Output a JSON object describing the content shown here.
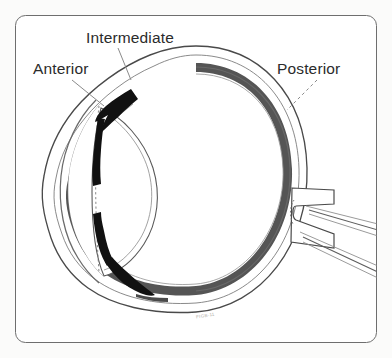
{
  "figure": {
    "name": "eye-cross-section-uveal-tract",
    "caption_credit": "FIGB-11",
    "frame": {
      "border_color": "#6e6e6e",
      "border_width_px": 1,
      "corner_radius_px": 10,
      "inset_px": 15,
      "fill_color": "#ffffff"
    },
    "background_color": "#fbfbfa"
  },
  "labels": [
    {
      "id": "anterior",
      "text": "Anterior",
      "x": 33,
      "y": 61,
      "color": "#2b2b2b"
    },
    {
      "id": "intermediate",
      "text": "Intermediate",
      "x": 86,
      "y": 30,
      "color": "#2b2b2b"
    },
    {
      "id": "posterior",
      "text": "Posterior",
      "x": 277,
      "y": 61,
      "color": "#2b2b2b"
    }
  ],
  "leader_lines": [
    {
      "id": "anterior-leader",
      "style": "solid",
      "from": [
        72,
        80
      ],
      "to": [
        101,
        103
      ],
      "color": "#8a8a8a"
    },
    {
      "id": "intermediate-leader",
      "style": "solid",
      "from": [
        118,
        48
      ],
      "to": [
        131,
        77
      ],
      "color": "#8a8a8a"
    },
    {
      "id": "posterior-leader",
      "style": "dashed",
      "from": [
        316,
        80
      ],
      "to": [
        288,
        108
      ],
      "color": "#8a8a8a"
    }
  ],
  "anatomy": {
    "structures": [
      {
        "name": "sclera-outer-wall",
        "color": "#ffffff",
        "stroke": "#4a4a4a"
      },
      {
        "name": "choroid-band",
        "color": "#555555"
      },
      {
        "name": "retina-inner-line",
        "color": "#8f8f8f"
      },
      {
        "name": "cornea",
        "color": "#ffffff",
        "stroke": "#6a6a6a"
      },
      {
        "name": "lens",
        "color": "#ffffff",
        "stroke": "#5a5a5a"
      },
      {
        "name": "iris-upper",
        "color": "#111111"
      },
      {
        "name": "iris-lower",
        "color": "#111111"
      },
      {
        "name": "ciliary-body-upper",
        "color": "#111111"
      },
      {
        "name": "ciliary-body-lower",
        "color": "#111111"
      },
      {
        "name": "optic-nerve",
        "color": "#ffffff",
        "stroke": "#4a4a4a"
      },
      {
        "name": "retinal-vessel-upper",
        "color": "#ffffff",
        "stroke": "#6a6a6a"
      },
      {
        "name": "retinal-vessel-lower",
        "color": "#ffffff",
        "stroke": "#6a6a6a"
      },
      {
        "name": "vitreous-chamber",
        "color": "#ffffff"
      },
      {
        "name": "anterior-chamber",
        "color": "#ffffff"
      }
    ]
  },
  "colors": {
    "ink_dark": "#111111",
    "choroid_gray": "#555555",
    "outline_gray": "#4a4a4a",
    "light_gray": "#9a9a9a",
    "text": "#2b2b2b",
    "frame": "#6e6e6e",
    "page_bg": "#fbfbfa"
  }
}
